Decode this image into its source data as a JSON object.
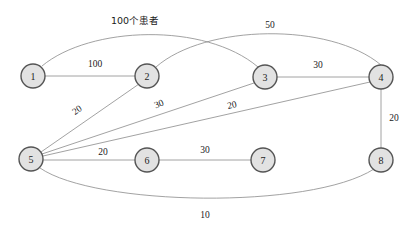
{
  "diagram": {
    "colors": {
      "node_fill": "#e2e2e2",
      "node_stroke": "#555555",
      "edge_stroke": "#8a8a8a",
      "text": "#1a1a1a",
      "background": "#ffffff"
    },
    "nodes": [
      {
        "id": "1",
        "label": "1",
        "x": 33,
        "y": 76,
        "r": 12
      },
      {
        "id": "2",
        "label": "2",
        "x": 147,
        "y": 76,
        "r": 12
      },
      {
        "id": "3",
        "label": "3",
        "x": 265,
        "y": 77,
        "r": 12
      },
      {
        "id": "4",
        "label": "4",
        "x": 381,
        "y": 77,
        "r": 12
      },
      {
        "id": "5",
        "label": "5",
        "x": 31,
        "y": 159,
        "r": 12
      },
      {
        "id": "6",
        "label": "6",
        "x": 147,
        "y": 160,
        "r": 12
      },
      {
        "id": "7",
        "label": "7",
        "x": 263,
        "y": 160,
        "r": 12
      },
      {
        "id": "8",
        "label": "8",
        "x": 381,
        "y": 160,
        "r": 12
      }
    ],
    "edges": [
      {
        "id": "e-1-3",
        "from": "1",
        "to": "3",
        "label": "100个患者",
        "label_x": 135,
        "label_y": 20,
        "label_rotate": 0,
        "path": "M 42 66 C 90 26, 205 22, 258 67",
        "curved": true
      },
      {
        "id": "e-2-4",
        "from": "2",
        "to": "4",
        "label": "50",
        "label_x": 270,
        "label_y": 25,
        "label_rotate": 0,
        "path": "M 156 67 C 205 24, 330 22, 381 65",
        "curved": true
      },
      {
        "id": "e-1-2",
        "from": "1",
        "to": "2",
        "label": "100",
        "label_x": 95,
        "label_y": 64,
        "label_rotate": 0,
        "path": "M 45 76 L 135 76",
        "curved": false
      },
      {
        "id": "e-3-4",
        "from": "3",
        "to": "4",
        "label": "30",
        "label_x": 318,
        "label_y": 65,
        "label_rotate": 0,
        "path": "M 277 77 L 369 77",
        "curved": false
      },
      {
        "id": "e-4-8",
        "from": "4",
        "to": "8",
        "label": "20",
        "label_x": 394,
        "label_y": 118,
        "label_rotate": 0,
        "path": "M 381 89 L 381 148",
        "curved": false
      },
      {
        "id": "e-5-2",
        "from": "5",
        "to": "2",
        "label": "20",
        "label_x": 77,
        "label_y": 110,
        "label_rotate": -36,
        "path": "M 41 152 L 139 84",
        "curved": false
      },
      {
        "id": "e-5-3",
        "from": "5",
        "to": "3",
        "label": "30",
        "label_x": 159,
        "label_y": 104,
        "label_rotate": -22,
        "path": "M 42 154 L 254 83",
        "curved": false
      },
      {
        "id": "e-5-4",
        "from": "5",
        "to": "4",
        "label": "20",
        "label_x": 232,
        "label_y": 105,
        "label_rotate": -12,
        "path": "M 43 156 L 370 82",
        "curved": false
      },
      {
        "id": "e-5-6",
        "from": "5",
        "to": "6",
        "label": "20",
        "label_x": 103,
        "label_y": 152,
        "label_rotate": 0,
        "path": "M 43 160 L 135 160",
        "curved": false
      },
      {
        "id": "e-6-7",
        "from": "6",
        "to": "7",
        "label": "30",
        "label_x": 205,
        "label_y": 150,
        "label_rotate": 0,
        "path": "M 159 160 L 251 160",
        "curved": false
      },
      {
        "id": "e-5-8",
        "from": "5",
        "to": "8",
        "label": "10",
        "label_x": 205,
        "label_y": 215,
        "label_rotate": 0,
        "path": "M 40 168 C 95 206, 310 210, 374 169",
        "curved": true
      }
    ]
  }
}
